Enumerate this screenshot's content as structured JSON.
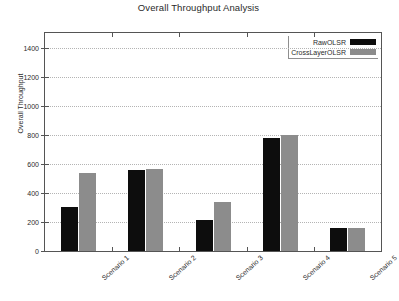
{
  "chart_data": {
    "type": "bar",
    "title": "Overall Throughput Analysis",
    "xlabel": "",
    "ylabel": "Overall Throughput",
    "categories": [
      "Scenario 1",
      "Scenario 2",
      "Scenario 3",
      "Scenario 4",
      "Scenario 5"
    ],
    "series": [
      {
        "name": "RawOLSR",
        "color": "#0d0d0d",
        "values": [
          300,
          560,
          210,
          780,
          155
        ]
      },
      {
        "name": "CrossLayerOLSR",
        "color": "#8c8c8c",
        "values": [
          540,
          565,
          340,
          800,
          160
        ]
      }
    ],
    "ylim": [
      0,
      1500
    ],
    "yticks": [
      0,
      200,
      400,
      600,
      800,
      1000,
      1200,
      1400
    ],
    "ytick_labels": [
      "0",
      "200",
      "400",
      "600",
      "800",
      "1000",
      "1200",
      "1400"
    ],
    "grid": true,
    "legend_position": "top-right"
  },
  "legend": {
    "entries": [
      {
        "label": "RawOLSR",
        "swatch": "black-swatch"
      },
      {
        "label": "CrossLayerOLSR",
        "swatch": "gray-swatch"
      }
    ]
  }
}
